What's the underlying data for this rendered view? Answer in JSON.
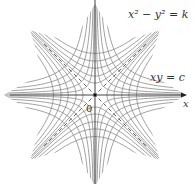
{
  "figure": {
    "width": 195,
    "height": 184,
    "origin_px": [
      95,
      95
    ],
    "scale_px_per_unit": 12,
    "curve_color": "#8a8a8a",
    "axis_color": "#444444",
    "dash_color": "#555555",
    "background": "#ffffff"
  },
  "labels": {
    "family1": "x² − y² = k",
    "family2": "xy = c",
    "x_axis": "x",
    "origin": "0"
  },
  "families": {
    "x2_minus_y2_eq_k": {
      "k_values": [
        -12,
        -8,
        -5,
        -2.5,
        -1,
        1,
        2.5,
        5,
        8,
        12
      ]
    },
    "xy_eq_c": {
      "c_values": [
        -6,
        -4,
        -2.5,
        -1.25,
        -0.5,
        0.5,
        1.25,
        2.5,
        4,
        6
      ]
    }
  },
  "asymptotes": {
    "lines": [
      "y = x",
      "y = -x"
    ],
    "style": "dashed"
  },
  "clip_radius_units": 7.6
}
